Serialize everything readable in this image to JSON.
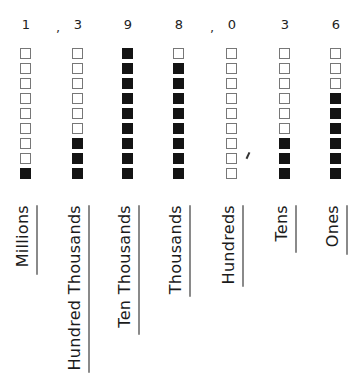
{
  "number": "1,398,036",
  "rows_per_column": 9,
  "columns": [
    {
      "place": "Millions",
      "digit": "1",
      "value": 1,
      "filled": [
        false,
        false,
        false,
        false,
        false,
        false,
        false,
        false,
        true
      ],
      "label_length": 68,
      "underline_length": 70
    },
    {
      "place": "Hundred Thousands",
      "digit": "3",
      "value": 3,
      "filled": [
        false,
        false,
        false,
        false,
        false,
        false,
        true,
        true,
        true
      ],
      "label_length": 160,
      "underline_length": 168
    },
    {
      "place": "Ten Thousands",
      "digit": "9",
      "value": 9,
      "filled": [
        true,
        true,
        true,
        true,
        true,
        true,
        true,
        true,
        true
      ],
      "label_length": 124,
      "underline_length": 130
    },
    {
      "place": "Thousands",
      "digit": "8",
      "value": 8,
      "filled": [
        false,
        true,
        true,
        true,
        true,
        true,
        true,
        true,
        true
      ],
      "label_length": 90,
      "underline_length": 92
    },
    {
      "place": "Hundreds",
      "digit": "0",
      "value": 0,
      "filled": [
        false,
        false,
        false,
        false,
        false,
        false,
        false,
        false,
        false
      ],
      "label_length": 80,
      "underline_length": 82
    },
    {
      "place": "Tens",
      "digit": "3",
      "value": 3,
      "filled": [
        false,
        false,
        false,
        false,
        false,
        false,
        true,
        true,
        true
      ],
      "label_length": 42,
      "underline_length": 48
    },
    {
      "place": "Ones",
      "digit": "6",
      "value": 6,
      "filled": [
        false,
        false,
        false,
        true,
        true,
        true,
        true,
        true,
        true
      ],
      "label_length": 46,
      "underline_length": 50
    }
  ],
  "separators": [
    ",",
    ","
  ],
  "colors": {
    "filled_box": "#141414",
    "empty_box_border": "#777777",
    "underline": "#8a8a8a"
  }
}
